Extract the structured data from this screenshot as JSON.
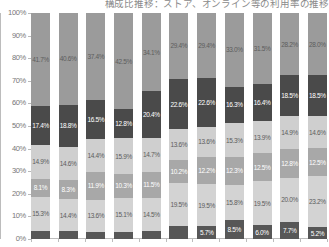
{
  "chart": {
    "title": "構成比推移：ストア、オンライン等の利用率の推移",
    "y_axis": {
      "ticks": [
        "100%",
        "90%",
        "80%",
        "70%",
        "60%",
        "50%",
        "40%",
        "30%",
        "20%",
        "10%",
        "0%"
      ],
      "min": 0,
      "max": 100
    }
  },
  "chart_data": {
    "type": "bar",
    "subtype": "stacked-100-percent",
    "title": "構成比推移：ストア、オンライン等の利用率の推移",
    "xlabel": "",
    "ylabel": "",
    "ylim": [
      0,
      100
    ],
    "ytick_labels": [
      "0%",
      "10%",
      "20%",
      "30%",
      "40%",
      "50%",
      "60%",
      "70%",
      "80%",
      "90%",
      "100%"
    ],
    "grid": false,
    "legend": "none",
    "categories": [
      "1",
      "2",
      "3",
      "4",
      "5",
      "6",
      "7",
      "8",
      "9",
      "10",
      "11"
    ],
    "stack_order": "bottom-to-top",
    "series": [
      {
        "name": "segment-1",
        "color": "#575757",
        "values": [
          3.6,
          3.4,
          3.2,
          3.2,
          3.3,
          5.7,
          5.7,
          8.5,
          6.0,
          7.7,
          5.2
        ]
      },
      {
        "name": "segment-2",
        "color": "#d3d3d3",
        "values": [
          15.3,
          14.4,
          13.6,
          15.1,
          14.5,
          19.5,
          19.5,
          15.8,
          19.5,
          20.0,
          23.2
        ]
      },
      {
        "name": "segment-3",
        "color": "#a8a8a8",
        "values": [
          8.1,
          8.3,
          11.9,
          10.3,
          11.5,
          10.2,
          12.2,
          12.3,
          12.5,
          12.8,
          12.5
        ]
      },
      {
        "name": "segment-4",
        "color": "#cfcfcf",
        "values": [
          14.9,
          14.6,
          14.4,
          15.9,
          14.7,
          13.6,
          13.6,
          15.3,
          13.9,
          14.9,
          14.6
        ]
      },
      {
        "name": "segment-5",
        "color": "#4a4a4a",
        "values": [
          17.4,
          18.8,
          16.5,
          12.8,
          20.4,
          22.6,
          22.6,
          16.3,
          16.4,
          18.5,
          18.5
        ]
      },
      {
        "name": "segment-6",
        "color": "#9b9b9b",
        "values": [
          41.7,
          40.6,
          37.4,
          42.5,
          34.1,
          29.4,
          29.4,
          33.0,
          31.5,
          28.2,
          28.0
        ]
      }
    ],
    "bars": [
      {
        "category": "1",
        "segments": [
          {
            "label": "3.6%",
            "value": 3.6,
            "tone": "dark",
            "show_label": false
          },
          {
            "label": "15.3%",
            "value": 15.3,
            "tone": "light",
            "show_label": true
          },
          {
            "label": "8.1%",
            "value": 8.1,
            "tone": "dark",
            "show_label": true
          },
          {
            "label": "14.9%",
            "value": 14.9,
            "tone": "light",
            "show_label": true
          },
          {
            "label": "17.4%",
            "value": 17.4,
            "tone": "dark",
            "show_label": true
          },
          {
            "label": "41.7%",
            "value": 41.7,
            "tone": "light",
            "show_label": true
          }
        ]
      },
      {
        "category": "2",
        "segments": [
          {
            "label": "3.4%",
            "value": 3.4,
            "tone": "dark",
            "show_label": false
          },
          {
            "label": "14.4%",
            "value": 14.4,
            "tone": "light",
            "show_label": true
          },
          {
            "label": "8.3%",
            "value": 8.3,
            "tone": "dark",
            "show_label": true
          },
          {
            "label": "14.6%",
            "value": 14.6,
            "tone": "light",
            "show_label": true
          },
          {
            "label": "18.8%",
            "value": 18.8,
            "tone": "dark",
            "show_label": true
          },
          {
            "label": "40.6%",
            "value": 40.6,
            "tone": "light",
            "show_label": true
          }
        ]
      },
      {
        "category": "3",
        "segments": [
          {
            "label": "3.2%",
            "value": 3.2,
            "tone": "dark",
            "show_label": false
          },
          {
            "label": "13.6%",
            "value": 13.6,
            "tone": "light",
            "show_label": true
          },
          {
            "label": "11.9%",
            "value": 11.9,
            "tone": "dark",
            "show_label": true
          },
          {
            "label": "14.4%",
            "value": 14.4,
            "tone": "light",
            "show_label": true
          },
          {
            "label": "16.5%",
            "value": 16.5,
            "tone": "dark",
            "show_label": true
          },
          {
            "label": "37.4%",
            "value": 37.4,
            "tone": "light",
            "show_label": true
          }
        ]
      },
      {
        "category": "4",
        "segments": [
          {
            "label": "3.2%",
            "value": 3.2,
            "tone": "dark",
            "show_label": false
          },
          {
            "label": "15.1%",
            "value": 15.1,
            "tone": "light",
            "show_label": true
          },
          {
            "label": "10.3%",
            "value": 10.3,
            "tone": "dark",
            "show_label": true
          },
          {
            "label": "15.9%",
            "value": 15.9,
            "tone": "light",
            "show_label": true
          },
          {
            "label": "12.8%",
            "value": 12.8,
            "tone": "dark",
            "show_label": true
          },
          {
            "label": "42.5%",
            "value": 42.5,
            "tone": "light",
            "show_label": true
          }
        ]
      },
      {
        "category": "5",
        "segments": [
          {
            "label": "3.3%",
            "value": 3.3,
            "tone": "dark",
            "show_label": false
          },
          {
            "label": "14.5%",
            "value": 14.5,
            "tone": "light",
            "show_label": true
          },
          {
            "label": "11.5%",
            "value": 11.5,
            "tone": "dark",
            "show_label": true
          },
          {
            "label": "14.7%",
            "value": 14.7,
            "tone": "light",
            "show_label": true
          },
          {
            "label": "20.4%",
            "value": 20.4,
            "tone": "dark",
            "show_label": true
          },
          {
            "label": "34.1%",
            "value": 34.1,
            "tone": "light",
            "show_label": true
          }
        ]
      },
      {
        "category": "6",
        "segments": [
          {
            "label": "5.7%",
            "value": 5.7,
            "tone": "dark",
            "show_label": false
          },
          {
            "label": "19.5%",
            "value": 19.5,
            "tone": "light",
            "show_label": true
          },
          {
            "label": "10.2%",
            "value": 10.2,
            "tone": "dark",
            "show_label": true
          },
          {
            "label": "13.6%",
            "value": 13.6,
            "tone": "light",
            "show_label": true
          },
          {
            "label": "22.6%",
            "value": 22.6,
            "tone": "dark",
            "show_label": true
          },
          {
            "label": "29.4%",
            "value": 29.4,
            "tone": "light",
            "show_label": true
          }
        ]
      },
      {
        "category": "7",
        "segments": [
          {
            "label": "5.7%",
            "value": 5.7,
            "tone": "dark",
            "show_label": true
          },
          {
            "label": "19.5%",
            "value": 19.5,
            "tone": "light",
            "show_label": true
          },
          {
            "label": "12.2%",
            "value": 12.2,
            "tone": "dark",
            "show_label": true
          },
          {
            "label": "13.6%",
            "value": 13.6,
            "tone": "light",
            "show_label": true
          },
          {
            "label": "22.6%",
            "value": 22.6,
            "tone": "dark",
            "show_label": true
          },
          {
            "label": "29.4%",
            "value": 29.4,
            "tone": "light",
            "show_label": true
          }
        ]
      },
      {
        "category": "8",
        "segments": [
          {
            "label": "8.5%",
            "value": 8.5,
            "tone": "dark",
            "show_label": true
          },
          {
            "label": "15.8%",
            "value": 15.8,
            "tone": "light",
            "show_label": true
          },
          {
            "label": "12.3%",
            "value": 12.3,
            "tone": "dark",
            "show_label": true
          },
          {
            "label": "15.3%",
            "value": 15.3,
            "tone": "light",
            "show_label": true
          },
          {
            "label": "16.3%",
            "value": 16.3,
            "tone": "dark",
            "show_label": true
          },
          {
            "label": "33.0%",
            "value": 33.0,
            "tone": "light",
            "show_label": true
          }
        ]
      },
      {
        "category": "9",
        "segments": [
          {
            "label": "6.0%",
            "value": 6.0,
            "tone": "dark",
            "show_label": true
          },
          {
            "label": "19.5%",
            "value": 19.5,
            "tone": "light",
            "show_label": true
          },
          {
            "label": "12.5%",
            "value": 12.5,
            "tone": "dark",
            "show_label": true
          },
          {
            "label": "13.9%",
            "value": 13.9,
            "tone": "light",
            "show_label": true
          },
          {
            "label": "16.4%",
            "value": 16.4,
            "tone": "dark",
            "show_label": true
          },
          {
            "label": "31.5%",
            "value": 31.5,
            "tone": "light",
            "show_label": true
          }
        ]
      },
      {
        "category": "10",
        "segments": [
          {
            "label": "7.7%",
            "value": 7.7,
            "tone": "dark",
            "show_label": true
          },
          {
            "label": "20.0%",
            "value": 20.0,
            "tone": "light",
            "show_label": true
          },
          {
            "label": "12.8%",
            "value": 12.8,
            "tone": "dark",
            "show_label": true
          },
          {
            "label": "14.9%",
            "value": 14.9,
            "tone": "light",
            "show_label": true
          },
          {
            "label": "18.5%",
            "value": 18.5,
            "tone": "dark",
            "show_label": true
          },
          {
            "label": "28.2%",
            "value": 28.2,
            "tone": "light",
            "show_label": true
          }
        ]
      },
      {
        "category": "11",
        "segments": [
          {
            "label": "5.2%",
            "value": 5.2,
            "tone": "dark",
            "show_label": true
          },
          {
            "label": "23.2%",
            "value": 23.2,
            "tone": "light",
            "show_label": true
          },
          {
            "label": "12.5%",
            "value": 12.5,
            "tone": "dark",
            "show_label": true
          },
          {
            "label": "14.6%",
            "value": 14.6,
            "tone": "light",
            "show_label": true
          },
          {
            "label": "18.5%",
            "value": 18.5,
            "tone": "dark",
            "show_label": true
          },
          {
            "label": "28.0%",
            "value": 28.0,
            "tone": "light",
            "show_label": true
          }
        ]
      }
    ],
    "extra_bottom_labels": [
      "21.5%",
      "11.9%",
      "15.5%",
      "17.7%",
      "26.3%"
    ]
  }
}
